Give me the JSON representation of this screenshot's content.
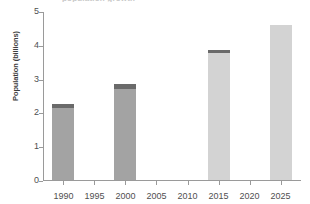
{
  "chart_data": {
    "type": "bar",
    "title": "",
    "xlabel": "",
    "ylabel": "Population (billions)",
    "categories": [
      "1990",
      "1995",
      "2000",
      "2005",
      "2010",
      "2015",
      "2020",
      "2025"
    ],
    "values": [
      2.26,
      null,
      2.85,
      null,
      null,
      3.85,
      null,
      4.59
    ],
    "series": [
      {
        "name": "Population (billions)",
        "values": [
          2.26,
          null,
          2.85,
          null,
          null,
          3.85,
          null,
          4.59
        ],
        "segment_main": [
          2.13,
          null,
          2.7,
          null,
          null,
          3.76,
          null,
          4.59
        ],
        "segment_cap": [
          0.13,
          null,
          0.15,
          null,
          null,
          0.09,
          null,
          0.0
        ]
      }
    ],
    "ylim": [
      0,
      5
    ],
    "yticks": [
      0,
      1,
      2,
      3,
      4,
      5
    ],
    "ytick_labels": [
      "0",
      "1",
      "2",
      "3",
      "4",
      "5"
    ],
    "grid": false,
    "legend": "none",
    "bar_styles": [
      {
        "category": "1990",
        "fill": "#a3a3a3",
        "cap": "#6a6a6a",
        "has_cap": true
      },
      {
        "category": "1995",
        "fill": "",
        "cap": "",
        "has_cap": false
      },
      {
        "category": "2000",
        "fill": "#a3a3a3",
        "cap": "#6a6a6a",
        "has_cap": true
      },
      {
        "category": "2005",
        "fill": "",
        "cap": "",
        "has_cap": false
      },
      {
        "category": "2010",
        "fill": "",
        "cap": "",
        "has_cap": false
      },
      {
        "category": "2015",
        "fill": "#d3d3d3",
        "cap": "#6a6a6a",
        "has_cap": true
      },
      {
        "category": "2020",
        "fill": "",
        "cap": "",
        "has_cap": false
      },
      {
        "category": "2025",
        "fill": "#d3d3d3",
        "cap": "",
        "has_cap": false
      }
    ]
  },
  "colors": {
    "axis": "#9a9a9a",
    "text": "#4f4f4f",
    "bar_dark": "#a3a3a3",
    "bar_light": "#d3d3d3",
    "bar_cap": "#6a6a6a",
    "background": "#ffffff"
  },
  "title_sliver": "population growth"
}
